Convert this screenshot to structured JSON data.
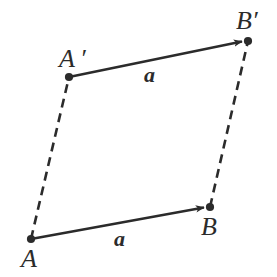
{
  "figure": {
    "kind": "vector-translation-diagram",
    "background_color": "#ffffff",
    "stroke_color": "#2b2b2b",
    "canvas": {
      "width": 277,
      "height": 277
    },
    "points": [
      {
        "id": "A",
        "label": "A",
        "x": 31,
        "y": 239,
        "label_x": 21,
        "label_y": 246
      },
      {
        "id": "Ap",
        "label": "A ′",
        "x": 69,
        "y": 77,
        "label_x": 59,
        "label_y": 46
      },
      {
        "id": "B",
        "label": "B",
        "x": 210,
        "y": 207,
        "label_x": 201,
        "label_y": 214
      },
      {
        "id": "Bp",
        "label": "B′",
        "x": 248,
        "y": 41,
        "label_x": 236,
        "label_y": 8
      }
    ],
    "vectors": [
      {
        "id": "vector-a-bottom",
        "label": "a",
        "from": "A",
        "to": "B",
        "style": "solid-arrow",
        "label_x": 114,
        "label_y": 228
      },
      {
        "id": "vector-a-top",
        "label": "a",
        "from": "Ap",
        "to": "Bp",
        "style": "solid-arrow",
        "label_x": 144,
        "label_y": 64
      }
    ],
    "connectors": [
      {
        "id": "connector-A-Ap",
        "from": "A",
        "to": "Ap",
        "style": "dashed"
      },
      {
        "id": "connector-B-Bp",
        "from": "B",
        "to": "Bp",
        "style": "dashed"
      }
    ]
  }
}
